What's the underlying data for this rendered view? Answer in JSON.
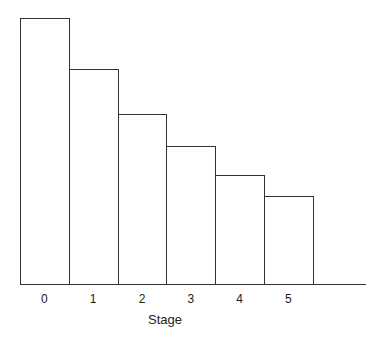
{
  "chart_data": {
    "type": "bar",
    "title": "",
    "xlabel": "Stage",
    "ylabel": "",
    "categories": [
      "0",
      "1",
      "2",
      "3",
      "4",
      "5"
    ],
    "values": [
      100,
      81,
      64,
      52,
      41,
      33
    ],
    "value_note": "relative bar heights (no y-axis shown); stage 0 normalized to 100",
    "ylim": [
      0,
      100
    ],
    "grid": false,
    "legend": null,
    "bar_style": {
      "fill": "#ffffff",
      "stroke": "#333333"
    }
  }
}
